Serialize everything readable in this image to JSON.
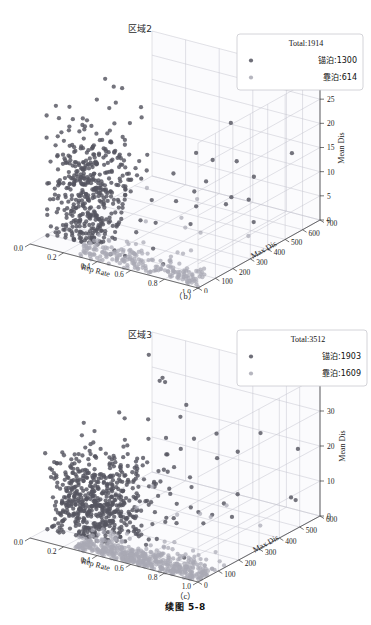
{
  "page": {
    "book_caption": "续图 5-8",
    "background": "#ffffff"
  },
  "figures": [
    {
      "id": "fig-b",
      "caption": "（b）",
      "title": "区域2",
      "legend": {
        "total_label": "Total:1914",
        "entries": [
          {
            "label": "锚泊:1300",
            "color": "#555560",
            "marker": "circle"
          },
          {
            "label": "靠泊:614",
            "color": "#a9a9b4",
            "marker": "circle"
          }
        ]
      },
      "chart_data": {
        "type": "scatter",
        "projection": "3d",
        "title": "区域2",
        "xlabel": "Rep Rate",
        "ylabel": "Max Dis",
        "zlabel": "Mean Dis",
        "xlim": [
          0.0,
          1.0
        ],
        "ylim": [
          0,
          700
        ],
        "zlim": [
          0,
          30
        ],
        "xticks": [
          "0.0",
          "0.2",
          "0.4",
          "0.6",
          "0.8",
          "1.0"
        ],
        "yticks": [
          "0",
          "100",
          "200",
          "300",
          "400",
          "500",
          "600",
          "700"
        ],
        "zticks": [
          "0",
          "5",
          "10",
          "15",
          "20",
          "25",
          "30"
        ],
        "grid": true,
        "legend_position": "top-right",
        "series": [
          {
            "name": "锚泊:1300",
            "count": 1300,
            "color": "#555560",
            "cluster": {
              "x_mean": 0.17,
              "x_sd": 0.1,
              "y_mean": 90,
              "y_sd": 110,
              "z_mean": 9,
              "z_sd": 7
            },
            "outliers": 95
          },
          {
            "name": "靠泊:614",
            "count": 614,
            "color": "#a9a9b4",
            "cluster": {
              "x_mean": 0.62,
              "x_sd": 0.22,
              "y_mean": 60,
              "y_sd": 55,
              "z_mean": 0.6,
              "z_sd": 0.7
            },
            "outliers": 25
          }
        ]
      }
    },
    {
      "id": "fig-c",
      "caption": "（c）",
      "title": "区域3",
      "legend": {
        "total_label": "Total:3512",
        "entries": [
          {
            "label": "锚泊:1903",
            "color": "#555560",
            "marker": "circle"
          },
          {
            "label": "靠泊:1609",
            "color": "#a9a9b4",
            "marker": "circle"
          }
        ]
      },
      "chart_data": {
        "type": "scatter",
        "projection": "3d",
        "title": "区域3",
        "xlabel": "Rep Rate",
        "ylabel": "Max Dis",
        "zlabel": "Mean Dis",
        "xlim": [
          0.0,
          1.0
        ],
        "ylim": [
          0,
          600
        ],
        "zlim": [
          0,
          40
        ],
        "xticks": [
          "0.0",
          "0.2",
          "0.4",
          "0.6",
          "0.8",
          "1.0"
        ],
        "yticks": [
          "0",
          "100",
          "200",
          "300",
          "400",
          "500",
          "600"
        ],
        "zticks": [
          "0",
          "10",
          "20",
          "30",
          "40"
        ],
        "grid": true,
        "legend_position": "top-right",
        "series": [
          {
            "name": "锚泊:1903",
            "count": 1903,
            "color": "#555560",
            "cluster": {
              "x_mean": 0.22,
              "x_sd": 0.12,
              "y_mean": 80,
              "y_sd": 100,
              "z_mean": 9,
              "z_sd": 7
            },
            "outliers": 150
          },
          {
            "name": "靠泊:1609",
            "count": 1609,
            "color": "#a9a9b4",
            "cluster": {
              "x_mean": 0.6,
              "x_sd": 0.2,
              "y_mean": 55,
              "y_sd": 50,
              "z_mean": 0.6,
              "z_sd": 0.8
            },
            "outliers": 40
          }
        ]
      }
    }
  ]
}
